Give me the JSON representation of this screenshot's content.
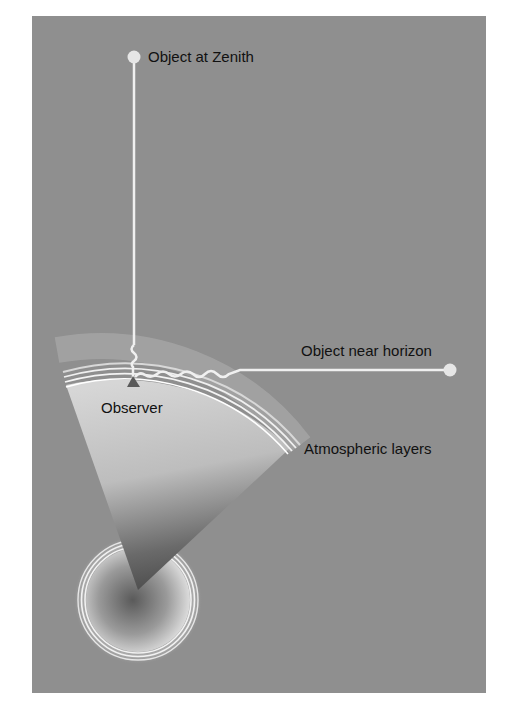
{
  "figure": {
    "background_color": "#8f8f8f",
    "labels": {
      "zenith": "Object at Zenith",
      "horizon": "Object near horizon",
      "observer": "Observer",
      "atmosphere": "Atmospheric layers"
    },
    "elements": [
      {
        "name": "zenith-object",
        "shape": "circle"
      },
      {
        "name": "horizon-object",
        "shape": "circle"
      },
      {
        "name": "observer-marker",
        "shape": "triangle"
      },
      {
        "name": "earth-wedge",
        "shape": "sector"
      },
      {
        "name": "atmospheric-layers",
        "shape": "arcs"
      },
      {
        "name": "earth-core-rings",
        "shape": "concentric-circles"
      }
    ]
  }
}
